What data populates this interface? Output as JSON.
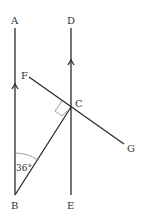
{
  "diagram": {
    "type": "geometry",
    "points": {
      "A": {
        "label": "A",
        "x": 15,
        "y": 28
      },
      "B": {
        "label": "B",
        "x": 15,
        "y": 195
      },
      "D": {
        "label": "D",
        "x": 71,
        "y": 28
      },
      "E": {
        "label": "E",
        "x": 71,
        "y": 195
      },
      "C": {
        "label": "C",
        "x": 71,
        "y": 107
      },
      "F": {
        "label": "F",
        "x": 29,
        "y": 77
      },
      "G": {
        "label": "G",
        "x": 124,
        "y": 144
      }
    },
    "angle_label": "36°",
    "right_angle_at": "C",
    "parallel_marks": [
      "AB",
      "DE"
    ],
    "colors": {
      "line": "#2b2b2b",
      "text": "#333333",
      "mark": "#888888"
    }
  }
}
